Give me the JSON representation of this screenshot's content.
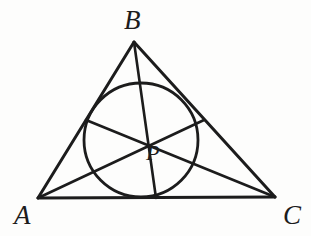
{
  "figure": {
    "kind": "euclidean-geometry-diagram",
    "background_color": "#fdfdfc",
    "ink_color": "#1c1c1c",
    "canvas": {
      "width": 311,
      "height": 236
    },
    "labels": {
      "A": "A",
      "B": "B",
      "C": "C",
      "P": "P"
    },
    "points": {
      "A": {
        "x": 38,
        "y": 198
      },
      "B": {
        "x": 134,
        "y": 42
      },
      "C": {
        "x": 275,
        "y": 197
      },
      "P": {
        "x": 141,
        "y": 134
      },
      "mid_AB": {
        "x": 86,
        "y": 120
      },
      "mid_BC": {
        "x": 204,
        "y": 120
      },
      "mid_AC": {
        "x": 156,
        "y": 198
      }
    },
    "incircle": {
      "center": {
        "x": 141,
        "y": 140
      },
      "radius": 57
    },
    "segments": [
      {
        "name": "side-AB",
        "from": "A",
        "to": "B"
      },
      {
        "name": "side-BC",
        "from": "B",
        "to": "C"
      },
      {
        "name": "side-AC",
        "from": "A",
        "to": "C"
      },
      {
        "name": "cevian-A-to-midBC",
        "from": "A",
        "to": "mid_BC"
      },
      {
        "name": "cevian-B-to-midAC",
        "from": "B",
        "to": "mid_AC"
      },
      {
        "name": "cevian-C-to-midAB",
        "from": "C",
        "to": "mid_AB"
      }
    ],
    "stroke_widths": {
      "triangle": 3.0,
      "cevian": 2.6,
      "circle": 2.8
    }
  }
}
